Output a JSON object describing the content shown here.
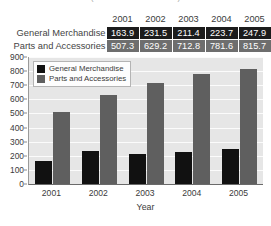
{
  "title_partial": "(dollar amounts in millions)",
  "table": {
    "corner_label": "",
    "columns": [
      "2001",
      "2002",
      "2003",
      "2004",
      "2005"
    ],
    "rows": [
      {
        "label": "General Merchandise",
        "style": "dark",
        "values": [
          "163.9",
          "231.5",
          "211.4",
          "223.7",
          "247.9"
        ]
      },
      {
        "label": "Parts and Accessories",
        "style": "gray",
        "values": [
          "507.3",
          "629.2",
          "712.8",
          "781.6",
          "815.7"
        ]
      }
    ]
  },
  "legend": {
    "items": [
      {
        "label": "General Merchandise",
        "color": "#111111"
      },
      {
        "label": "Parts and Accessories",
        "color": "#5f5f5f"
      }
    ]
  },
  "chart_data": {
    "type": "bar",
    "title": "",
    "xlabel": "Year",
    "ylabel": "",
    "categories": [
      "2001",
      "2002",
      "2003",
      "2004",
      "2005"
    ],
    "series": [
      {
        "name": "General Merchandise",
        "color": "#111111",
        "values": [
          163.9,
          231.5,
          211.4,
          223.7,
          247.9
        ]
      },
      {
        "name": "Parts and Accessories",
        "color": "#5f5f5f",
        "values": [
          507.3,
          629.2,
          712.8,
          781.6,
          815.7
        ]
      }
    ],
    "ylim": [
      0,
      900
    ],
    "yticks": [
      0,
      100,
      200,
      300,
      400,
      500,
      600,
      700,
      800,
      900
    ],
    "ytick_labels": [
      "0",
      "100",
      "200",
      "300",
      "400",
      "500",
      "600",
      "700",
      "800",
      "900"
    ],
    "grid": true,
    "legend_position": "top-left",
    "plot_background": "#e6e6e6",
    "gridline_color": "#fbfbfb"
  }
}
